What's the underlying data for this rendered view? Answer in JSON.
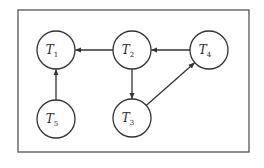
{
  "diagram": {
    "type": "directed-graph",
    "colors": {
      "stroke": "#333333",
      "background": "#ffffff"
    },
    "frame": {
      "x": 18,
      "y": 10,
      "width": 231,
      "height": 142
    },
    "node_radius": 19,
    "nodes": [
      {
        "id": "T1",
        "base": "T",
        "sub": "1",
        "cx": 56,
        "cy": 50
      },
      {
        "id": "T2",
        "base": "T",
        "sub": "2",
        "cx": 132,
        "cy": 50
      },
      {
        "id": "T4",
        "base": "T",
        "sub": "4",
        "cx": 209,
        "cy": 50
      },
      {
        "id": "T5",
        "base": "T",
        "sub": "5",
        "cx": 56,
        "cy": 119
      },
      {
        "id": "T3",
        "base": "T",
        "sub": "3",
        "cx": 132,
        "cy": 118
      }
    ],
    "edges": [
      {
        "from": "T2",
        "to": "T1"
      },
      {
        "from": "T4",
        "to": "T2"
      },
      {
        "from": "T2",
        "to": "T3"
      },
      {
        "from": "T3",
        "to": "T4"
      },
      {
        "from": "T5",
        "to": "T1"
      }
    ]
  }
}
